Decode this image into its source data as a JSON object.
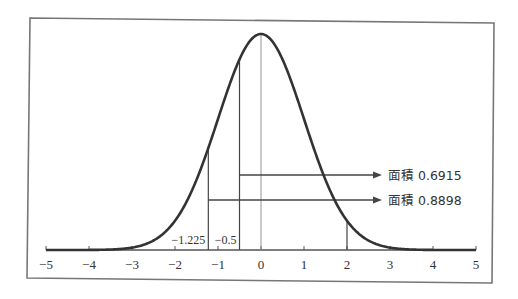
{
  "chart_data": {
    "type": "line",
    "title": "",
    "xlabel": "",
    "ylabel": "",
    "xlim": [
      -5,
      5
    ],
    "grid": false,
    "curve": {
      "name": "standard normal density",
      "mean": 0,
      "sd": 1
    },
    "x_ticks": [
      -5,
      -4,
      -3,
      -2,
      -1,
      0,
      1,
      2,
      3,
      4,
      5
    ],
    "x_tick_labels": [
      "−5",
      "−4",
      "−3",
      "−2",
      "−1",
      "0",
      "1",
      "2",
      "3",
      "4",
      "5"
    ],
    "vertical_lines": [
      {
        "x": -1.225,
        "label": "−1.225"
      },
      {
        "x": -0.5,
        "label": "−0.5"
      },
      {
        "x": 0,
        "label": ""
      },
      {
        "x": 2,
        "label": ""
      }
    ],
    "annotations": [
      {
        "from_x": -0.5,
        "to_x": 2,
        "area": 0.6915,
        "text": "面積 0.6915"
      },
      {
        "from_x": -1.225,
        "to_x": 2,
        "area": 0.8898,
        "text": "面積 0.8898"
      }
    ]
  },
  "colors": {
    "curve": "#333333",
    "lines": "#555555",
    "frame": "#777777"
  }
}
